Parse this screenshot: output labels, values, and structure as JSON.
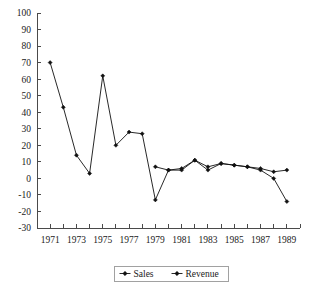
{
  "chart_data": {
    "type": "line",
    "title": "",
    "xlabel": "",
    "ylabel": "",
    "x": [
      1971,
      1972,
      1973,
      1974,
      1975,
      1976,
      1977,
      1978,
      1979,
      1980,
      1981,
      1982,
      1983,
      1984,
      1985,
      1986,
      1987,
      1988,
      1989
    ],
    "series": [
      {
        "name": "Sales",
        "marker": "diamond",
        "color": "#111111",
        "x": [
          1971,
          1972,
          1973,
          1974,
          1975,
          1976,
          1977,
          1978,
          1979,
          1980,
          1981,
          1982,
          1983,
          1984,
          1985,
          1986,
          1987,
          1988,
          1989
        ],
        "values": [
          70,
          43,
          14,
          3,
          62,
          20,
          28,
          27,
          -13,
          5,
          6,
          11,
          5,
          9,
          8,
          7,
          5,
          0,
          -14
        ]
      },
      {
        "name": "Revenue",
        "marker": "diamond",
        "color": "#111111",
        "x": [
          1979,
          1980,
          1981,
          1982,
          1983,
          1984,
          1985,
          1986,
          1987,
          1988,
          1989
        ],
        "values": [
          7,
          5,
          5,
          11,
          7,
          9,
          8,
          7,
          6,
          4,
          5
        ]
      }
    ],
    "xlim": [
      1970,
      1990
    ],
    "ylim": [
      -30,
      100
    ],
    "ytick_step": 10,
    "yticks": [
      -30,
      -20,
      -10,
      0,
      10,
      20,
      30,
      40,
      50,
      60,
      70,
      80,
      90,
      100
    ],
    "ytick_labels": [
      "-30",
      "-20",
      "-10",
      "0",
      "10",
      "20",
      "30",
      "40",
      "50",
      "60",
      "70",
      "80",
      "90",
      "100"
    ],
    "xticks": [
      1970,
      1971,
      1972,
      1973,
      1974,
      1975,
      1976,
      1977,
      1978,
      1979,
      1980,
      1981,
      1982,
      1983,
      1984,
      1985,
      1986,
      1987,
      1988,
      1989,
      1990
    ],
    "xtick_labels_shown": [
      "1971",
      "1973",
      "1975",
      "1977",
      "1979",
      "1981",
      "1983",
      "1985",
      "1987",
      "1989"
    ],
    "xtick_label_values": [
      1971,
      1973,
      1975,
      1977,
      1979,
      1981,
      1983,
      1985,
      1987,
      1989
    ],
    "grid": false,
    "legend_position": "bottom",
    "legend_entries": [
      "Sales",
      "Revenue"
    ],
    "background_color": "#ffffff",
    "axis_color": "#4a4a4a"
  },
  "legend": {
    "entries": [
      {
        "label": "Sales"
      },
      {
        "label": "Revenue"
      }
    ]
  }
}
